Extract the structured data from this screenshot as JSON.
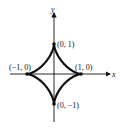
{
  "chart_data": {
    "type": "line",
    "title": "",
    "xlabel": "x",
    "ylabel": "y",
    "curve": "astroid",
    "cusp_points": [
      {
        "label": "(0, 1)",
        "x": 0,
        "y": 1
      },
      {
        "label": "(1, 0)",
        "x": 1,
        "y": 0
      },
      {
        "label": "(0, −1)",
        "x": 0,
        "y": -1
      },
      {
        "label": "(−1, 0)",
        "x": -1,
        "y": 0
      }
    ],
    "grid": false
  },
  "labels": {
    "x_axis": "x",
    "y_axis": "y",
    "top": "(0, 1)",
    "right": "(1, 0)",
    "bottom": "(0, −1)",
    "left": "(−1, 0)"
  }
}
